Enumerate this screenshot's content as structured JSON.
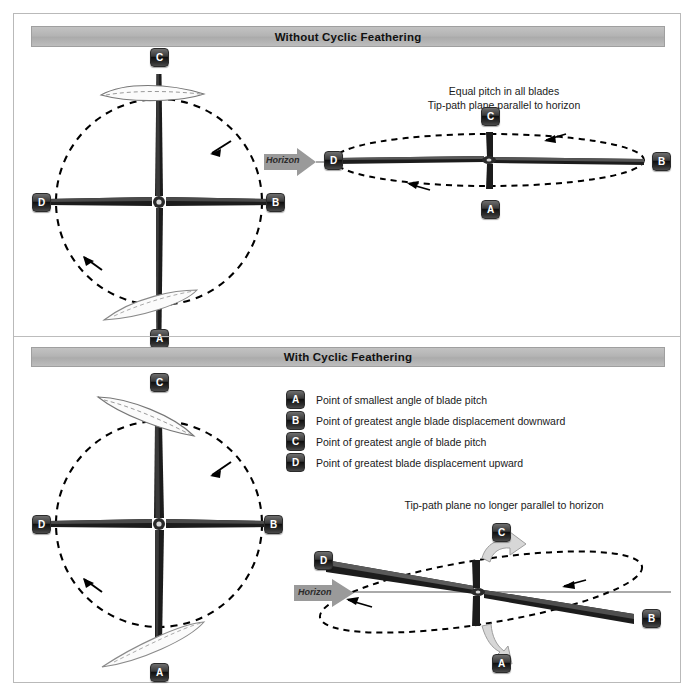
{
  "figure": {
    "sections": [
      {
        "id": "without",
        "title": "Without Cyclic Feathering"
      },
      {
        "id": "with",
        "title": "With Cyclic Feathering"
      }
    ],
    "notes": {
      "top_right_line1": "Equal pitch in all blades",
      "top_right_line2": "Tip-path plane parallel to horizon",
      "bottom_right": "Tip-path plane no longer parallel to horizon"
    },
    "horizon_label": "Horizon",
    "markers": {
      "a": "A",
      "b": "B",
      "c": "C",
      "d": "D"
    },
    "legend": [
      {
        "key": "A",
        "text": "Point of smallest angle of blade pitch"
      },
      {
        "key": "B",
        "text": "Point of greatest angle blade displacement downward"
      },
      {
        "key": "C",
        "text": "Point of greatest angle of blade pitch"
      },
      {
        "key": "D",
        "text": "Point of greatest blade displacement upward"
      }
    ],
    "colors": {
      "bar_fill": "#b4b4b4",
      "bar_border": "#9f9f9f",
      "frame_border": "#b9b9b9",
      "marker_dark": "#101010",
      "marker_text": "#ffffff",
      "arrow_gray": "#9a9a9a",
      "blade_dark": "#1c1c1c",
      "dashed_path": "#000000",
      "text": "#1a1a1a"
    }
  }
}
